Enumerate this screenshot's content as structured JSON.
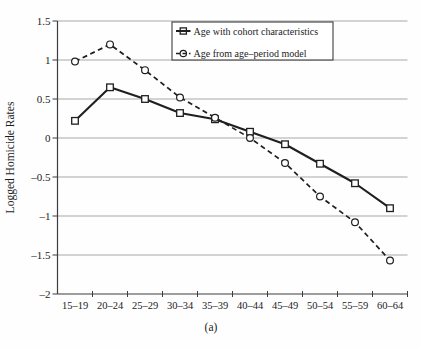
{
  "figure": {
    "caption": "(a)"
  },
  "chart_data": {
    "type": "line",
    "title": "",
    "xlabel": "",
    "ylabel": "Logged Homicide Rates",
    "categories": [
      "15–19",
      "20–24",
      "25–29",
      "30–34",
      "35–39",
      "40–44",
      "45–49",
      "50–54",
      "55–59",
      "60–64"
    ],
    "series": [
      {
        "name": "Age with cohort characteristics",
        "style": "solid",
        "marker": "square",
        "values": [
          0.22,
          0.65,
          0.5,
          0.32,
          0.24,
          0.08,
          -0.08,
          -0.33,
          -0.58,
          -0.9
        ]
      },
      {
        "name": "Age from age–period model",
        "style": "dashed",
        "marker": "circle",
        "values": [
          0.98,
          1.2,
          0.87,
          0.52,
          0.26,
          0.0,
          -0.32,
          -0.75,
          -1.08,
          -1.57
        ]
      }
    ],
    "ylim": [
      -2,
      1.5
    ],
    "yticks": [
      1.5,
      1,
      0.5,
      0,
      -0.5,
      -1,
      -1.5,
      -2
    ],
    "ytick_labels": [
      "1.5",
      "1",
      "0.5",
      "0",
      "–0.5",
      "–1",
      "–1.5",
      "–2"
    ],
    "grid": "horizontal",
    "legend_position": "top-center-inside",
    "colors": {
      "line": "#1f1f1f",
      "grid": "#a8a8a8",
      "axis": "#3c3c3c",
      "text": "#1c1c1c",
      "background": "#ffffff"
    }
  }
}
